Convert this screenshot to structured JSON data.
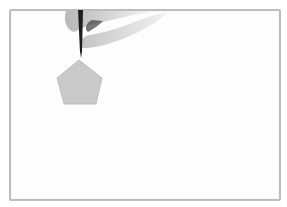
{
  "scene": {
    "description": "Hand holding a marker drawing a gray pentagon on a whiteboard",
    "colors": {
      "background": "#ffffff",
      "board_fill": "#fdfdfd",
      "board_border": "#bdbdbd",
      "pentagon_fill": "#c9c9c9",
      "pentagon_stroke": "#b5b5b5",
      "marker": "#1e1e1e",
      "hand": "#cfcfcf"
    },
    "shapes": {
      "pentagon_points": "79,60 102,78 96,104 64,104 57,78"
    }
  }
}
